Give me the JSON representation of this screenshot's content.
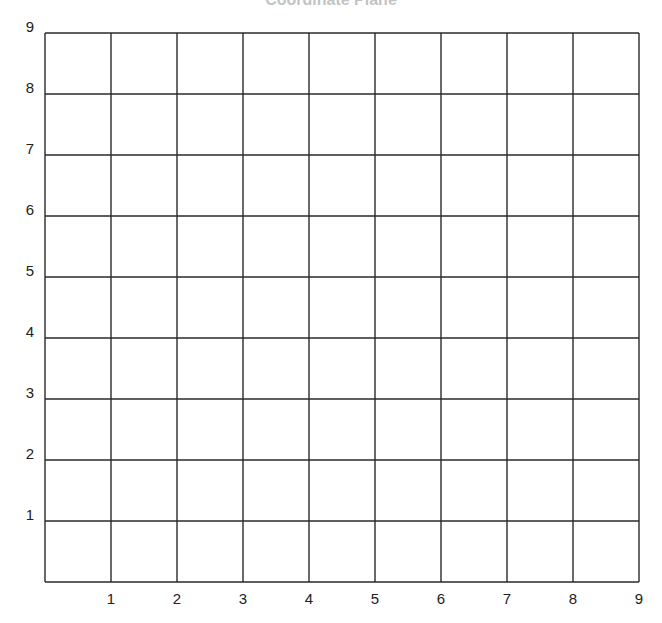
{
  "chart_data": {
    "type": "grid",
    "title": "Coordinate Plane",
    "xlabel": "",
    "ylabel": "",
    "xlim": [
      0,
      9
    ],
    "ylim": [
      0,
      9
    ],
    "x_ticks": [
      "1",
      "2",
      "3",
      "4",
      "5",
      "6",
      "7",
      "8",
      "9"
    ],
    "y_ticks": [
      "1",
      "2",
      "3",
      "4",
      "5",
      "6",
      "7",
      "8",
      "9"
    ],
    "grid": true,
    "series": []
  }
}
